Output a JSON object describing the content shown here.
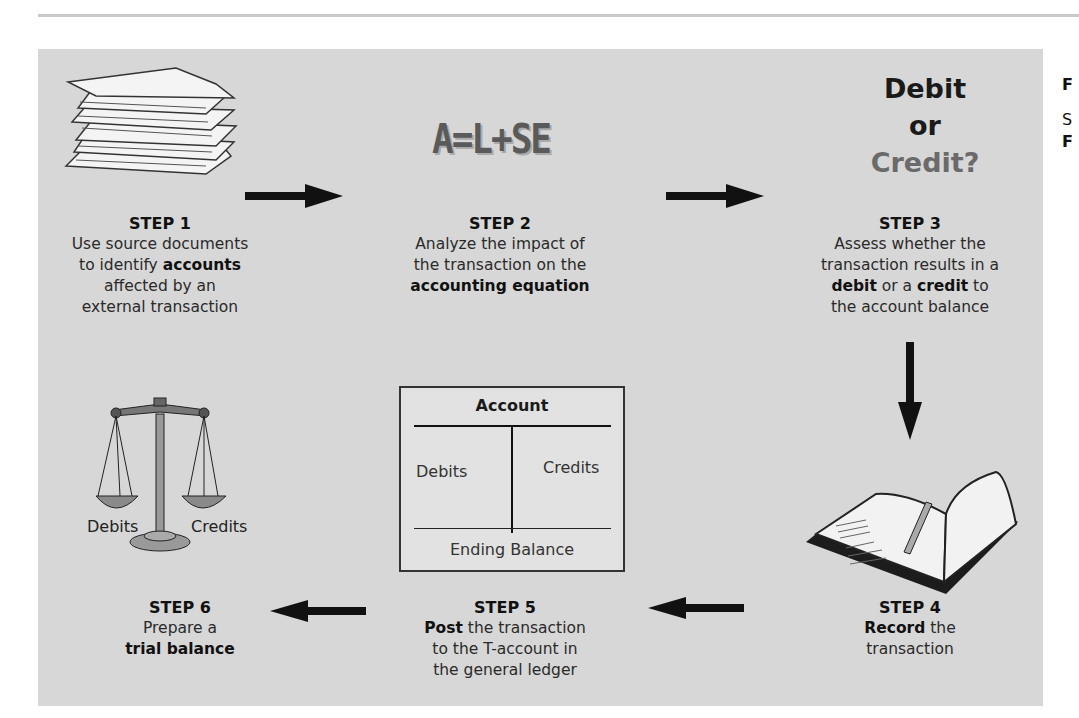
{
  "figure": {
    "header_rule": "",
    "side_fragments": [
      "F",
      "S",
      "F"
    ],
    "steps": [
      {
        "id": 1,
        "title": "STEP 1",
        "lines": [
          [
            "Use source documents"
          ],
          [
            "to identify ",
            {
              "b": "accounts"
            }
          ],
          [
            "affected by an"
          ],
          [
            "external transaction"
          ]
        ],
        "text_plain": [
          "Use source documents",
          "to identify",
          "accounts",
          "affected by an",
          "external transaction"
        ],
        "icon": "document-stack-icon"
      },
      {
        "id": 2,
        "title": "STEP 2",
        "text_plain": [
          "Analyze the impact of",
          "the transaction on the",
          "accounting equation"
        ],
        "equation": "A=L+SE",
        "icon": "equation-icon"
      },
      {
        "id": 3,
        "title": "STEP 3",
        "text_plain": [
          "Assess whether the",
          "transaction results in a",
          "debit",
          " or a ",
          "credit",
          " to",
          "the account balance"
        ],
        "header_lines": [
          "Debit",
          "or",
          "Credit?"
        ],
        "icon": "debit-or-credit-icon"
      },
      {
        "id": 4,
        "title": "STEP 4",
        "text_plain": [
          "Record",
          " the",
          "transaction"
        ],
        "icon": "journal-book-icon"
      },
      {
        "id": 5,
        "title": "STEP 5",
        "text_plain": [
          "Post",
          " the transaction",
          "to the T-account in",
          "the general ledger"
        ],
        "icon": "t-account-icon"
      },
      {
        "id": 6,
        "title": "STEP 6",
        "text_plain": [
          "Prepare a",
          "trial balance"
        ],
        "icon": "balance-scale-icon"
      }
    ],
    "t_account": {
      "header": "Account",
      "left": "Debits",
      "right": "Credits",
      "footer": "Ending Balance"
    },
    "scale_labels": {
      "left": "Debits",
      "right": "Credits"
    },
    "colors": {
      "panel": "#d7d7d7",
      "arrow": "#111111",
      "credit_text": "#6a6a6a"
    }
  }
}
